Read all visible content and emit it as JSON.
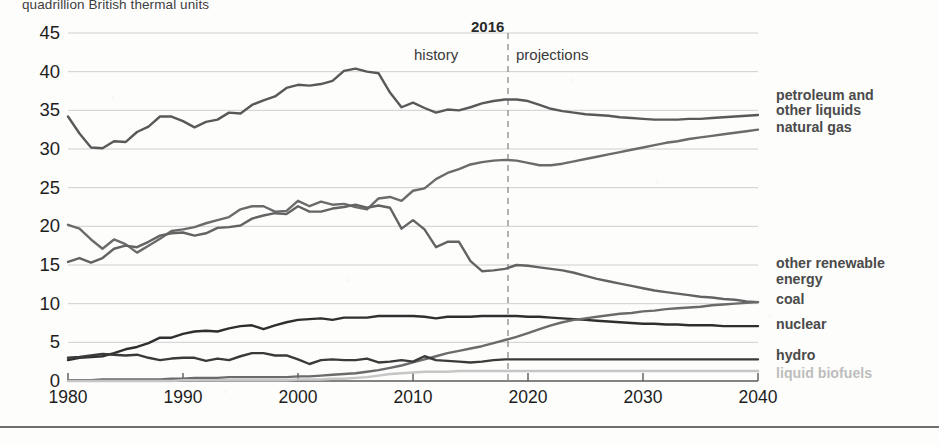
{
  "chart_data": {
    "type": "line",
    "title": "quadrillion British thermal units",
    "xlabel": "",
    "ylabel": "",
    "xlim": [
      1980,
      2040
    ],
    "ylim": [
      0,
      45
    ],
    "xticks": [
      1980,
      1990,
      2000,
      2010,
      2020,
      2030,
      2040
    ],
    "yticks": [
      0,
      5,
      10,
      15,
      20,
      25,
      30,
      35,
      40,
      45
    ],
    "grid": true,
    "legend_position": "right-inline",
    "annotations": {
      "divider_year": "2016",
      "history": "history",
      "projections": "projections",
      "divider_x": 2016
    },
    "x": [
      1980,
      1981,
      1982,
      1983,
      1984,
      1985,
      1986,
      1987,
      1988,
      1989,
      1990,
      1991,
      1992,
      1993,
      1994,
      1995,
      1996,
      1997,
      1998,
      1999,
      2000,
      2001,
      2002,
      2003,
      2004,
      2005,
      2006,
      2007,
      2008,
      2009,
      2010,
      2011,
      2012,
      2013,
      2014,
      2015,
      2016,
      2017,
      2018,
      2019,
      2020,
      2021,
      2022,
      2023,
      2024,
      2025,
      2026,
      2027,
      2028,
      2029,
      2030,
      2031,
      2032,
      2033,
      2034,
      2035,
      2036,
      2037,
      2038,
      2039,
      2040
    ],
    "series": [
      {
        "name": "petroleum and other liquids",
        "color": "#595959",
        "values": [
          34.2,
          32.0,
          30.2,
          30.1,
          31.0,
          30.9,
          32.2,
          32.9,
          34.2,
          34.2,
          33.6,
          32.8,
          33.5,
          33.8,
          34.7,
          34.6,
          35.7,
          36.3,
          36.8,
          37.9,
          38.3,
          38.2,
          38.4,
          38.8,
          40.1,
          40.4,
          40.0,
          39.8,
          37.3,
          35.4,
          36.0,
          35.3,
          34.7,
          35.1,
          35.0,
          35.4,
          35.9,
          36.2,
          36.4,
          36.4,
          36.2,
          35.7,
          35.2,
          34.9,
          34.7,
          34.5,
          34.4,
          34.3,
          34.1,
          34.0,
          33.9,
          33.8,
          33.8,
          33.8,
          33.9,
          33.9,
          34.0,
          34.1,
          34.2,
          34.3,
          34.4
        ]
      },
      {
        "name": "natural gas",
        "color": "#6b6b6b",
        "values": [
          20.2,
          19.7,
          18.3,
          17.1,
          18.3,
          17.7,
          16.6,
          17.5,
          18.4,
          19.4,
          19.6,
          19.9,
          20.4,
          20.8,
          21.2,
          22.2,
          22.6,
          22.6,
          21.9,
          22.0,
          23.3,
          22.6,
          23.2,
          22.8,
          22.9,
          22.5,
          22.2,
          23.6,
          23.8,
          23.3,
          24.6,
          24.9,
          26.1,
          26.9,
          27.4,
          28.0,
          28.3,
          28.5,
          28.6,
          28.5,
          28.2,
          27.9,
          27.9,
          28.1,
          28.4,
          28.7,
          29.0,
          29.3,
          29.6,
          29.9,
          30.2,
          30.5,
          30.8,
          31.0,
          31.3,
          31.5,
          31.7,
          31.9,
          32.1,
          32.3,
          32.5
        ]
      },
      {
        "name": "coal",
        "color": "#636363",
        "values": [
          15.4,
          15.9,
          15.3,
          15.9,
          17.1,
          17.5,
          17.3,
          18.0,
          18.8,
          19.1,
          19.2,
          18.8,
          19.1,
          19.8,
          19.9,
          20.1,
          21.0,
          21.4,
          21.7,
          21.6,
          22.6,
          21.9,
          21.9,
          22.3,
          22.5,
          22.8,
          22.4,
          22.7,
          22.4,
          19.7,
          20.8,
          19.6,
          17.3,
          18.0,
          18.0,
          15.5,
          14.2,
          14.3,
          14.5,
          15.0,
          14.9,
          14.7,
          14.5,
          14.3,
          14.0,
          13.6,
          13.2,
          12.9,
          12.6,
          12.3,
          12.0,
          11.7,
          11.5,
          11.3,
          11.1,
          10.9,
          10.8,
          10.6,
          10.5,
          10.3,
          10.2
        ]
      },
      {
        "name": "nuclear",
        "color": "#2f2f2f",
        "values": [
          2.7,
          3.0,
          3.1,
          3.2,
          3.6,
          4.1,
          4.4,
          4.9,
          5.6,
          5.6,
          6.1,
          6.4,
          6.5,
          6.4,
          6.8,
          7.1,
          7.2,
          6.7,
          7.2,
          7.6,
          7.9,
          8.0,
          8.1,
          7.9,
          8.2,
          8.2,
          8.2,
          8.4,
          8.4,
          8.4,
          8.4,
          8.3,
          8.1,
          8.3,
          8.3,
          8.3,
          8.4,
          8.4,
          8.4,
          8.4,
          8.3,
          8.3,
          8.2,
          8.1,
          8.0,
          7.9,
          7.8,
          7.7,
          7.6,
          7.5,
          7.4,
          7.4,
          7.3,
          7.3,
          7.2,
          7.2,
          7.2,
          7.1,
          7.1,
          7.1,
          7.1
        ]
      },
      {
        "name": "other renewable energy",
        "color": "#6b6b6b",
        "values": [
          0.1,
          0.1,
          0.1,
          0.2,
          0.2,
          0.2,
          0.2,
          0.2,
          0.2,
          0.3,
          0.3,
          0.4,
          0.4,
          0.4,
          0.5,
          0.5,
          0.5,
          0.5,
          0.5,
          0.5,
          0.6,
          0.6,
          0.7,
          0.8,
          0.9,
          1.0,
          1.2,
          1.4,
          1.7,
          2.0,
          2.4,
          2.8,
          3.2,
          3.6,
          3.9,
          4.2,
          4.5,
          4.9,
          5.3,
          5.7,
          6.2,
          6.7,
          7.2,
          7.6,
          7.9,
          8.1,
          8.3,
          8.5,
          8.7,
          8.8,
          9.0,
          9.1,
          9.3,
          9.4,
          9.5,
          9.6,
          9.8,
          9.9,
          10.0,
          10.1,
          10.2
        ]
      },
      {
        "name": "hydro",
        "color": "#3a3a3a",
        "values": [
          3.0,
          3.1,
          3.3,
          3.5,
          3.4,
          3.3,
          3.4,
          3.0,
          2.7,
          2.9,
          3.0,
          3.0,
          2.6,
          2.9,
          2.7,
          3.2,
          3.6,
          3.6,
          3.3,
          3.3,
          2.8,
          2.2,
          2.7,
          2.8,
          2.7,
          2.7,
          2.9,
          2.4,
          2.5,
          2.7,
          2.5,
          3.2,
          2.7,
          2.6,
          2.5,
          2.4,
          2.5,
          2.7,
          2.8,
          2.8,
          2.8,
          2.8,
          2.8,
          2.8,
          2.8,
          2.8,
          2.8,
          2.8,
          2.8,
          2.8,
          2.8,
          2.8,
          2.8,
          2.8,
          2.8,
          2.8,
          2.8,
          2.8,
          2.8,
          2.8,
          2.8
        ]
      },
      {
        "name": "liquid biofuels",
        "color": "#c6c6c6",
        "values": [
          0.0,
          0.0,
          0.0,
          0.0,
          0.0,
          0.0,
          0.0,
          0.0,
          0.0,
          0.0,
          0.1,
          0.1,
          0.1,
          0.1,
          0.1,
          0.1,
          0.1,
          0.1,
          0.1,
          0.1,
          0.2,
          0.2,
          0.2,
          0.3,
          0.3,
          0.4,
          0.5,
          0.7,
          0.9,
          1.0,
          1.1,
          1.2,
          1.2,
          1.2,
          1.3,
          1.3,
          1.3,
          1.3,
          1.3,
          1.3,
          1.3,
          1.3,
          1.3,
          1.3,
          1.3,
          1.3,
          1.3,
          1.3,
          1.3,
          1.3,
          1.3,
          1.3,
          1.3,
          1.3,
          1.3,
          1.3,
          1.3,
          1.3,
          1.3,
          1.3,
          1.3
        ]
      }
    ],
    "right_labels": [
      {
        "text": "petroleum and",
        "y": 88,
        "faint": false
      },
      {
        "text": "other liquids",
        "y": 103,
        "faint": false
      },
      {
        "text": "natural gas",
        "y": 120,
        "faint": false
      },
      {
        "text": "other renewable",
        "y": 256,
        "faint": false
      },
      {
        "text": "energy",
        "y": 272,
        "faint": false
      },
      {
        "text": "coal",
        "y": 292,
        "faint": false
      },
      {
        "text": "nuclear",
        "y": 317,
        "faint": false
      },
      {
        "text": "hydro",
        "y": 348,
        "faint": false
      },
      {
        "text": "liquid biofuels",
        "y": 366,
        "faint": true
      }
    ]
  }
}
